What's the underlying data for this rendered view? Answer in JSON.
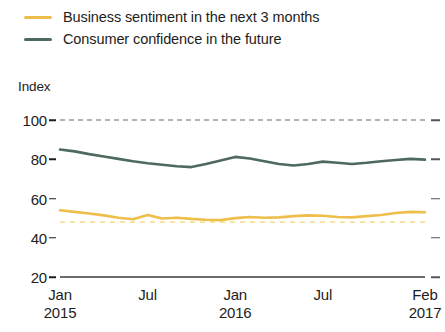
{
  "legend": {
    "items": [
      {
        "label": "Business sentiment in the next 3 months",
        "color": "#edbe4a",
        "key": "business_sentiment"
      },
      {
        "label": "Consumer confidence in the future",
        "color": "#4d6a5c",
        "key": "consumer_confidence"
      }
    ]
  },
  "axis": {
    "y_title": "Index",
    "y_ticks": [
      "100",
      "80",
      "60",
      "40",
      "20"
    ],
    "x_ticks": [
      {
        "month": "Jan",
        "year": "2015"
      },
      {
        "month": "Jul",
        "year": ""
      },
      {
        "month": "Jan",
        "year": "2016"
      },
      {
        "month": "Jul",
        "year": ""
      },
      {
        "month": "Feb",
        "year": "2017"
      }
    ]
  },
  "chart_data": {
    "type": "line",
    "title": "",
    "subtitle": "",
    "xlabel": "",
    "ylabel": "Index",
    "ylim": [
      20,
      100
    ],
    "yticks": [
      20,
      40,
      60,
      80,
      100
    ],
    "grid": false,
    "legend_position": "top-left",
    "x": [
      "Jan 2015",
      "Feb 2015",
      "Mar 2015",
      "Apr 2015",
      "May 2015",
      "Jun 2015",
      "Jul 2015",
      "Aug 2015",
      "Sep 2015",
      "Oct 2015",
      "Nov 2015",
      "Dec 2015",
      "Jan 2016",
      "Feb 2016",
      "Mar 2016",
      "Apr 2016",
      "May 2016",
      "Jun 2016",
      "Jul 2016",
      "Aug 2016",
      "Sep 2016",
      "Oct 2016",
      "Nov 2016",
      "Dec 2016",
      "Jan 2017",
      "Feb 2017"
    ],
    "x_tick_labels": [
      "Jan 2015",
      "Jul",
      "Jan 2016",
      "Jul",
      "Feb 2017"
    ],
    "series": [
      {
        "name": "Consumer confidence in the future",
        "color": "#4d6a5c",
        "values": [
          85.0,
          84.0,
          82.6,
          81.4,
          80.2,
          79.0,
          78.0,
          77.2,
          76.4,
          76.0,
          77.6,
          79.4,
          81.2,
          80.4,
          79.0,
          77.6,
          76.8,
          77.6,
          78.8,
          78.2,
          77.6,
          78.2,
          79.0,
          79.6,
          80.2,
          79.8
        ]
      },
      {
        "name": "Business sentiment in the next 3 months",
        "color": "#edbe4a",
        "values": [
          54.0,
          53.2,
          52.4,
          51.4,
          50.2,
          49.4,
          51.6,
          49.8,
          50.2,
          49.6,
          49.2,
          49.0,
          50.0,
          50.6,
          50.2,
          50.4,
          51.0,
          51.4,
          51.2,
          50.6,
          50.4,
          51.0,
          51.6,
          52.6,
          53.2,
          53.0
        ]
      }
    ],
    "reference_lines": [
      {
        "name": "upper-reference",
        "value": 100,
        "color": "#9a9a9a",
        "style": "dashed"
      },
      {
        "name": "neutral-reference",
        "value": 48,
        "color": "#f6de9f",
        "style": "dashed"
      }
    ]
  }
}
